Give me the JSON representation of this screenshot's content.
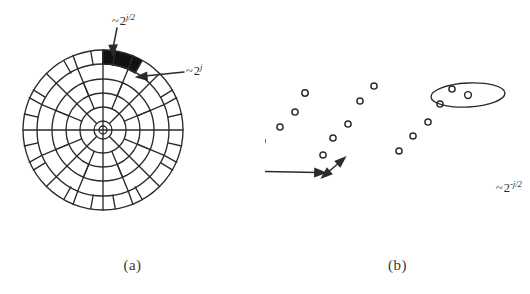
{
  "figure": {
    "background_color": "#ffffff",
    "ink_color": "#2b2b2b",
    "wedge_fill_color": "#111111"
  },
  "panels": [
    {
      "id": "a",
      "caption": "(a)",
      "kind": "polar-frequency-tiling",
      "description": "Polar partition of the frequency plane into dyadic annuli subdivided into angular wedges, with one wedge filled solid black.",
      "rings": 5,
      "inner_circle": true,
      "highlighted_wedge": {
        "ring_index": 5,
        "angle_start_deg": 60,
        "angle_end_deg": 90,
        "fill": "#111111"
      },
      "labels": [
        {
          "name": "wedge-length-label",
          "tilde": "~",
          "base": "2",
          "exponent": "j/2",
          "text": "~2^(j/2)",
          "points_to": "outer arc length of highlighted wedge"
        },
        {
          "name": "wedge-width-label",
          "tilde": "~",
          "base": "2",
          "exponent": "j",
          "text": "~2^(j)",
          "points_to": "radial width of highlighted wedge"
        }
      ]
    },
    {
      "id": "b",
      "caption": "(b)",
      "kind": "spatial-dot-lattice",
      "description": "Corresponding spatial sampling lattice: open circles arranged along curved arcs, with one circle enclosed by an ellipse indicating the effective support of a curvelet.",
      "dot_style": {
        "shape": "open-circle",
        "radius_px": 3.1,
        "stroke": "#2b2b2b",
        "stroke_width": 1.4
      },
      "ellipse": {
        "name": "curvelet-support-ellipse",
        "cx": 468,
        "cy": 95,
        "rx": 37,
        "ry": 12,
        "rotation_deg": -3
      },
      "dots": [
        [
          237,
          170
        ],
        [
          248,
          154
        ],
        [
          262,
          141
        ],
        [
          280,
          127
        ],
        [
          295,
          112
        ],
        [
          305,
          93
        ],
        [
          323,
          155
        ],
        [
          333,
          138
        ],
        [
          348,
          124
        ],
        [
          360,
          101
        ],
        [
          374,
          86
        ],
        [
          399,
          151
        ],
        [
          413,
          136
        ],
        [
          428,
          122
        ],
        [
          440,
          104
        ],
        [
          452,
          89
        ],
        [
          468,
          95
        ]
      ],
      "labels": [
        {
          "name": "long-spacing-label",
          "tilde": "~",
          "base": "2",
          "exponent": "-j/2",
          "text": "~2^(-j/2)",
          "measures": "long spacing along the arc"
        },
        {
          "name": "short-spacing-label",
          "tilde": "~",
          "base": "2",
          "exponent": "-j",
          "text": "~2^(-j)",
          "measures": "short spacing across the arc"
        }
      ],
      "arrows": [
        {
          "name": "long-spacing-arrow",
          "type": "double-headed",
          "x1": 234,
          "y1": 170,
          "x2": 321,
          "y2": 172
        },
        {
          "name": "short-spacing-arrow",
          "type": "double-headed",
          "x1": 322,
          "y1": 177,
          "x2": 344,
          "y2": 159
        }
      ]
    }
  ]
}
